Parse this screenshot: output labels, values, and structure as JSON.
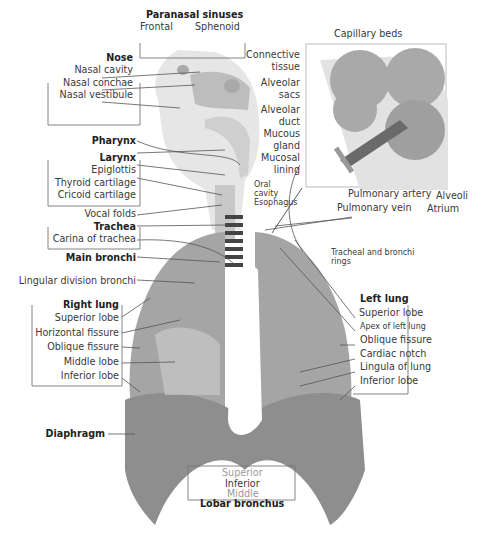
{
  "groups": {
    "paranasal": {
      "title": "Paranasal sinuses",
      "items": [
        "Frontal",
        "Sphenoid"
      ]
    },
    "nose": {
      "title": "Nose",
      "items": [
        "Nasal cavity",
        "Nasal conchae",
        "Nasal vestibule"
      ]
    },
    "pharynx": {
      "title": "Pharynx"
    },
    "larynx": {
      "title": "Larynx",
      "items": [
        "Epiglottis",
        "Thyroid cartilage",
        "Cricoid cartilage"
      ]
    },
    "vocal_folds": "Vocal folds",
    "trachea": {
      "title": "Trachea",
      "items": [
        "Carina of trachea"
      ]
    },
    "main_bronchi": "Main bronchi",
    "lingular": "Lingular division bronchi",
    "right_lung": {
      "title": "Right lung",
      "items": [
        "Superior lobe",
        "Horizontal fissure",
        "Oblique fissure",
        "Middle lobe",
        "Inferior lobe"
      ]
    },
    "diaphragm": "Diaphragm",
    "lobar_bronchus": {
      "title": "Lobar bronchus",
      "items": [
        "Superior",
        "Inferior",
        "Middle"
      ]
    },
    "left_lung": {
      "title": "Left lung",
      "items": [
        "Superior lobe",
        "Apex of left lung",
        "Oblique fissure",
        "Cardiac notch",
        "Lingula of lung",
        "Inferior lobe"
      ]
    },
    "rings": {
      "line1": "Tracheal and bronchi",
      "line2": "rings"
    },
    "oral": {
      "line1": "Oral",
      "line2": "cavity"
    },
    "esophagus": "Esophagus",
    "inset": {
      "capillary": "Capillary beds",
      "connective": [
        "Connective",
        "tissue"
      ],
      "sacs": [
        "Alveolar",
        "sacs"
      ],
      "duct": [
        "Alveolar",
        "duct"
      ],
      "mucous": [
        "Mucous",
        "gland"
      ],
      "mucosal": [
        "Mucosal",
        "lining"
      ],
      "pulm_artery": "Pulmonary artery",
      "pulm_vein": "Pulmonary vein",
      "alveoli": "Alveoli",
      "atrium": "Atrium"
    }
  },
  "colors": {
    "lung": "#9c9c9c",
    "lung_light": "#c4c4c4",
    "diaphragm": "#8a8a8a",
    "head": "#d6d6d6",
    "line": "#555555",
    "frame": "#777777"
  }
}
